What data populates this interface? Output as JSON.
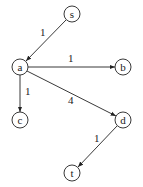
{
  "nodes": [
    {
      "id": "s",
      "label": "s",
      "x": 72,
      "y": 14
    },
    {
      "id": "a",
      "label": "a",
      "x": 20,
      "y": 67
    },
    {
      "id": "b",
      "label": "b",
      "x": 123,
      "y": 67
    },
    {
      "id": "c",
      "label": "c",
      "x": 20,
      "y": 120
    },
    {
      "id": "d",
      "label": "d",
      "x": 123,
      "y": 120
    },
    {
      "id": "t",
      "label": "t",
      "x": 72,
      "y": 173
    }
  ],
  "edges": [
    {
      "from": "s",
      "to": "a",
      "weight": "1"
    },
    {
      "from": "a",
      "to": "b",
      "weight": "1"
    },
    {
      "from": "a",
      "to": "c",
      "weight": "1"
    },
    {
      "from": "a",
      "to": "d",
      "weight": "4"
    },
    {
      "from": "d",
      "to": "t",
      "weight": "1"
    }
  ]
}
